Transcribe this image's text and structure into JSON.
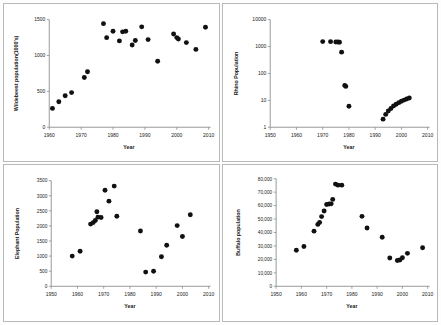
{
  "figure": {
    "title": "",
    "panel_count": 4,
    "marker_color": "#111111",
    "axis_color": "#8c8c8c",
    "background": "#ffffff"
  },
  "chart_data": [
    {
      "id": "wildebeest",
      "type": "scatter",
      "title": "",
      "xlabel": "Year",
      "ylabel": "Wildebeest population(1000's)",
      "xlim": [
        1960,
        2010
      ],
      "ylim": [
        0,
        1500
      ],
      "xticks": [
        1960,
        1970,
        1980,
        1990,
        2000,
        2010
      ],
      "xticklabels": [
        "1960",
        "1970",
        "1980",
        "1990",
        "2000",
        "2010"
      ],
      "yticks": [
        0,
        500,
        1000,
        1500
      ],
      "yticklabels": [
        "0",
        "500",
        "1000",
        "1500"
      ],
      "yscale": "linear",
      "grid": false,
      "legend": "none",
      "x": [
        1961,
        1963,
        1965,
        1967,
        1971,
        1972,
        1977,
        1978,
        1980,
        1982,
        1983,
        1984,
        1986,
        1987,
        1989,
        1991,
        1994,
        1999,
        2000,
        2000.5,
        2003,
        2006,
        2009
      ],
      "y": [
        263,
        356,
        439,
        483,
        693,
        773,
        1444,
        1249,
        1338,
        1204,
        1330,
        1338,
        1146,
        1210,
        1400,
        1222,
        920,
        1300,
        1250,
        1230,
        1180,
        1085,
        1395
      ]
    },
    {
      "id": "rhino",
      "type": "scatter",
      "title": "",
      "xlabel": "Year",
      "ylabel": "Rhino Population",
      "xlim": [
        1950,
        2010
      ],
      "ylim": [
        1,
        10000
      ],
      "xticks": [
        1950,
        1960,
        1970,
        1980,
        1990,
        2000,
        2010
      ],
      "xticklabels": [
        "1950",
        "1960",
        "1970",
        "1980",
        "1990",
        "2000",
        "2010"
      ],
      "yticks": [
        1,
        10,
        100,
        1000,
        10000
      ],
      "yticklabels": [
        "1",
        "10",
        "100",
        "1000",
        "10000"
      ],
      "yscale": "log",
      "grid": false,
      "legend": "none",
      "x": [
        1970,
        1973,
        1975,
        1975.8,
        1976.4,
        1977.2,
        1978.4,
        1978.8,
        1980,
        1993,
        1994,
        1995,
        1996,
        1997,
        1998,
        1999,
        2000,
        2001,
        2002,
        2003
      ],
      "y": [
        1530,
        1520,
        1480,
        1470,
        1450,
        620,
        36,
        33,
        6,
        2,
        3,
        4,
        5,
        6.2,
        7.2,
        8.2,
        9.3,
        10.2,
        11.2,
        12.2
      ]
    },
    {
      "id": "elephant",
      "type": "scatter",
      "title": "",
      "xlabel": "Year",
      "ylabel": "Elephant Population",
      "xlim": [
        1950,
        2010
      ],
      "ylim": [
        0,
        3500
      ],
      "xticks": [
        1950,
        1960,
        1970,
        1980,
        1990,
        2000,
        2010
      ],
      "xticklabels": [
        "1950",
        "1960",
        "1970",
        "1980",
        "1990",
        "2000",
        "2010"
      ],
      "yticks": [
        0,
        500,
        1000,
        1500,
        2000,
        2500,
        3000,
        3500
      ],
      "yticklabels": [
        "0",
        "500",
        "1000",
        "1500",
        "2000",
        "2500",
        "3000",
        "3500"
      ],
      "yscale": "linear",
      "grid": false,
      "legend": "none",
      "x": [
        1958,
        1961,
        1965,
        1966,
        1966.8,
        1967.4,
        1967.8,
        1969,
        1970.5,
        1972,
        1974,
        1975,
        1984,
        1986,
        1989,
        1992,
        1994,
        1998,
        2000,
        2003
      ],
      "y": [
        1000,
        1160,
        2060,
        2110,
        2180,
        2470,
        2290,
        2280,
        3180,
        2820,
        3320,
        2320,
        1830,
        470,
        500,
        980,
        1360,
        2010,
        1650,
        2370
      ]
    },
    {
      "id": "buffalo",
      "type": "scatter",
      "title": "",
      "xlabel": "Year",
      "ylabel": "Buffalo population",
      "xlim": [
        1950,
        2010
      ],
      "ylim": [
        0,
        80000
      ],
      "xticks": [
        1950,
        1960,
        1970,
        1980,
        1990,
        2000,
        2010
      ],
      "xticklabels": [
        "1950",
        "1960",
        "1970",
        "1980",
        "1990",
        "2000",
        "2010"
      ],
      "yticks": [
        0,
        10000,
        20000,
        30000,
        40000,
        50000,
        60000,
        70000,
        80000
      ],
      "yticklabels": [
        "0",
        "10,000",
        "20,000",
        "30,000",
        "40,000",
        "50,000",
        "60,000",
        "70,000",
        "80,000"
      ],
      "yscale": "linear",
      "grid": false,
      "legend": "none",
      "x": [
        1958,
        1961,
        1965,
        1966.5,
        1967.2,
        1968,
        1969,
        1970,
        1971,
        1971.8,
        1972.4,
        1973.5,
        1974.5,
        1976,
        1984,
        1986,
        1992,
        1995,
        1998,
        1999,
        2000,
        2002,
        2008
      ],
      "y": [
        26800,
        29600,
        41000,
        46000,
        47500,
        51800,
        56000,
        60800,
        61200,
        61300,
        64600,
        76000,
        75200,
        75200,
        52000,
        43300,
        36500,
        21000,
        19200,
        19500,
        21200,
        24500,
        28700
      ]
    }
  ]
}
